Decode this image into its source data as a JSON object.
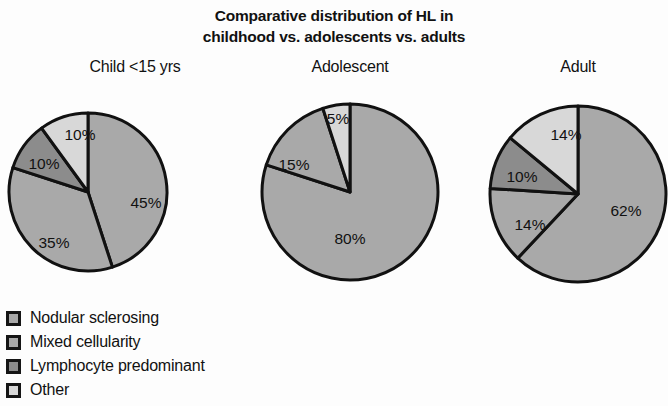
{
  "title": {
    "line1": "Comparative distribution of HL in",
    "line2": "childhood vs. adolescents vs. adults"
  },
  "colors": {
    "nodular_sclerosing": "#a9a9a9",
    "mixed_cellularity": "#a9a9a9",
    "lymphocyte_predominant": "#8c8c8c",
    "other": "#d8d8d8",
    "outline": "#111111",
    "background": "#fdfdfd"
  },
  "legend": {
    "items": [
      {
        "label": "Nodular sclerosing",
        "color": "#a9a9a9"
      },
      {
        "label": "Mixed cellularity",
        "color": "#a9a9a9"
      },
      {
        "label": "Lymphocyte predominant",
        "color": "#8c8c8c"
      },
      {
        "label": "Other",
        "color": "#d8d8d8"
      }
    ]
  },
  "chart_data": {
    "type": "pie",
    "title": "Comparative distribution of HL in childhood vs. adolescents vs. adults",
    "legend_position": "bottom-left",
    "categories": [
      "Nodular sclerosing",
      "Mixed cellularity",
      "Lymphocyte predominant",
      "Other"
    ],
    "units": "percent",
    "charts": [
      {
        "title": "Child <15 yrs",
        "labels": [
          "45%",
          "35%",
          "10%",
          "10%"
        ],
        "values": [
          45,
          35,
          10,
          10
        ],
        "slice_categories": [
          "Nodular sclerosing",
          "Mixed cellularity",
          "Lymphocyte predominant",
          "Other"
        ],
        "slice_colors": [
          "#a9a9a9",
          "#a9a9a9",
          "#8c8c8c",
          "#d8d8d8"
        ],
        "cx": 88,
        "cy": 108,
        "r": 79,
        "start_angle": 0,
        "label_positions": [
          {
            "x": 58,
            "y": 12
          },
          {
            "x": -34,
            "y": 52
          },
          {
            "x": -44,
            "y": -27
          },
          {
            "x": -8,
            "y": -56
          }
        ]
      },
      {
        "title": "Adolescent",
        "labels": [
          "80%",
          "15%",
          "5%"
        ],
        "values": [
          80,
          15,
          5
        ],
        "slice_categories": [
          "Nodular sclerosing",
          "Mixed cellularity",
          "Other"
        ],
        "slice_colors": [
          "#a9a9a9",
          "#a9a9a9",
          "#d8d8d8"
        ],
        "cx": 90,
        "cy": 108,
        "r": 88,
        "start_angle": 0,
        "label_positions": [
          {
            "x": 0,
            "y": 48
          },
          {
            "x": -56,
            "y": -26
          },
          {
            "x": -12,
            "y": -72
          }
        ]
      },
      {
        "title": "Adult",
        "labels": [
          "62%",
          "14%",
          "10%",
          "14%"
        ],
        "values": [
          62,
          14,
          10,
          14
        ],
        "slice_categories": [
          "Nodular sclerosing",
          "Mixed cellularity",
          "Lymphocyte predominant",
          "Other"
        ],
        "slice_colors": [
          "#a9a9a9",
          "#a9a9a9",
          "#8c8c8c",
          "#d8d8d8"
        ],
        "cx": 90,
        "cy": 110,
        "r": 88,
        "start_angle": 0,
        "label_positions": [
          {
            "x": 48,
            "y": 18
          },
          {
            "x": -48,
            "y": 32
          },
          {
            "x": -56,
            "y": -16
          },
          {
            "x": -12,
            "y": -58
          }
        ]
      }
    ]
  },
  "panels": [
    {
      "left": 0,
      "top": 58,
      "width": 270
    },
    {
      "left": 260,
      "top": 58,
      "width": 180
    },
    {
      "left": 488,
      "top": 58,
      "width": 180
    }
  ]
}
